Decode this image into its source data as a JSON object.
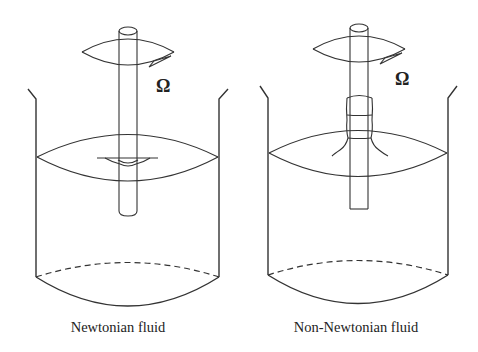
{
  "figure": {
    "panels": [
      {
        "id": "newtonian",
        "caption": "Newtonian fluid",
        "rotation_symbol": "Ω",
        "surface_behavior": "dip (vortex) around rotating rod"
      },
      {
        "id": "non-newtonian",
        "caption": "Non-Newtonian fluid",
        "rotation_symbol": "Ω",
        "surface_behavior": "fluid climbs the rotating rod (rod-climbing / Weissenberg effect)"
      }
    ],
    "colors": {
      "stroke": "#333333",
      "background": "#ffffff"
    }
  }
}
